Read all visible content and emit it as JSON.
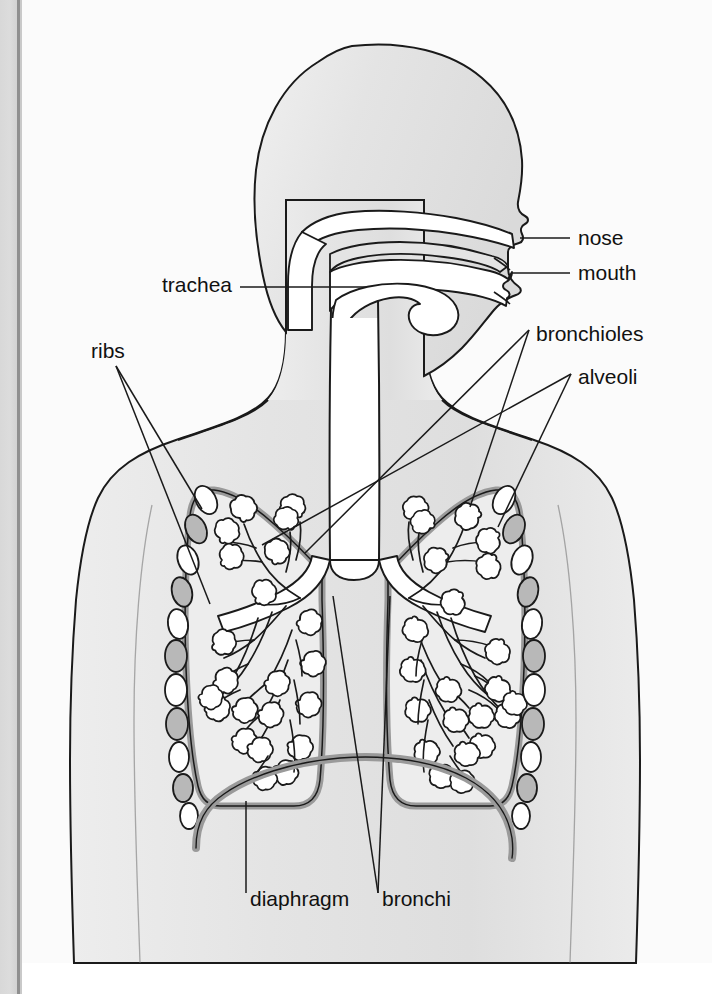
{
  "diagram": {
    "view": "right-facing profile head with frontal thorax",
    "panel_background": "#fbfbfb",
    "body_fill": "#e7e7e7",
    "outline_color": "#1a1a1a",
    "lung_wall_color": "#9a9a9a",
    "rib_fill_light": "#ffffff",
    "rib_fill_dark": "#b8b8b8",
    "airway_fill": "#ffffff",
    "gutter_color": "#d8d8d8"
  },
  "labels": {
    "nose": {
      "text": "nose",
      "x": 578,
      "y": 245,
      "anchor": "start"
    },
    "mouth": {
      "text": "mouth",
      "x": 578,
      "y": 280,
      "anchor": "start"
    },
    "bronchioles": {
      "text": "bronchioles",
      "x": 536,
      "y": 341,
      "anchor": "start"
    },
    "alveoli": {
      "text": "alveoli",
      "x": 578,
      "y": 384,
      "anchor": "start"
    },
    "trachea": {
      "text": "trachea",
      "x": 232,
      "y": 292,
      "anchor": "end"
    },
    "ribs": {
      "text": "ribs",
      "x": 91,
      "y": 358,
      "anchor": "start"
    },
    "diaphragm": {
      "text": "diaphragm",
      "x": 250,
      "y": 906,
      "anchor": "start"
    },
    "bronchi": {
      "text": "bronchi",
      "x": 382,
      "y": 906,
      "anchor": "start"
    }
  },
  "leader_lines": {
    "nose": [
      [
        520,
        238
      ],
      [
        570,
        238
      ]
    ],
    "mouth": [
      [
        512,
        273
      ],
      [
        570,
        273
      ]
    ],
    "bronchioles": [
      [
        305,
        553
      ],
      [
        529,
        330
      ]
    ],
    "bronchioles2": [
      [
        470,
        507
      ],
      [
        529,
        330
      ]
    ],
    "alveoli": [
      [
        262,
        545
      ],
      [
        571,
        374
      ]
    ],
    "alveoli2": [
      [
        498,
        527
      ],
      [
        571,
        374
      ]
    ],
    "trachea": [
      [
        240,
        287
      ],
      [
        366,
        287
      ]
    ],
    "ribs1": [
      [
        116,
        366
      ],
      [
        202,
        509
      ]
    ],
    "ribs2": [
      [
        116,
        366
      ],
      [
        210,
        604
      ]
    ],
    "diaphragm": [
      [
        246,
        801
      ],
      [
        246,
        893
      ]
    ],
    "bronchi1": [
      [
        333,
        596
      ],
      [
        378,
        893
      ]
    ],
    "bronchi2": [
      [
        390,
        596
      ],
      [
        378,
        893
      ]
    ]
  },
  "anatomy_parts": [
    "nose",
    "mouth",
    "trachea",
    "bronchi",
    "bronchioles",
    "alveoli",
    "ribs",
    "diaphragm",
    "lung-left",
    "lung-right",
    "head-profile",
    "neck",
    "torso",
    "nasal-cavity",
    "tongue"
  ]
}
